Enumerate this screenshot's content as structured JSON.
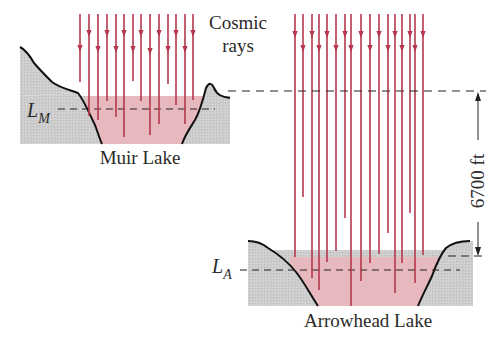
{
  "labels": {
    "cosmic_rays_line1": "Cosmic",
    "cosmic_rays_line2": "rays",
    "muir_lake": "Muir Lake",
    "arrowhead_lake": "Arrowhead Lake",
    "level_muir_main": "L",
    "level_muir_sub": "M",
    "level_arrowhead_main": "L",
    "level_arrowhead_sub": "A",
    "height_difference": "6700 ft"
  },
  "colors": {
    "ray": "#b5384f",
    "water": "#e8b8bf",
    "ground": "#cfcfcf",
    "outline": "#111111",
    "dash": "#222222"
  },
  "icons": {
    "ray_arrow": "arrowhead-down",
    "dimension_arrows": "arrow-up-and-down"
  }
}
